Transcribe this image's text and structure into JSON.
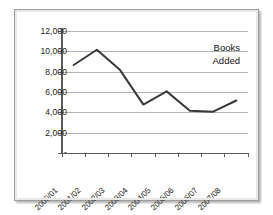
{
  "chart_data": {
    "type": "line",
    "title": "",
    "subtitle": "",
    "xlabel": "",
    "ylabel": "",
    "categories": [
      "2000/01",
      "2001/02",
      "2002/03",
      "2003/04",
      "2004/05",
      "2005/06",
      "2006/07",
      "2007/08"
    ],
    "series": [
      {
        "name": "Books Added",
        "values": [
          8700,
          10200,
          8200,
          4800,
          6100,
          4200,
          4100,
          5200
        ]
      }
    ],
    "ylim": [
      0,
      12000
    ],
    "ytick_values": [
      0,
      2000,
      4000,
      6000,
      8000,
      10000,
      12000
    ],
    "ytick_labels": [
      "-",
      "2,000",
      "4,000",
      "6,000",
      "8,000",
      "10,000",
      "12,000"
    ],
    "grid": true,
    "grid_axis": "y",
    "legend": "none",
    "annotations": [
      {
        "name": "series-label",
        "lines": [
          "Books",
          "Added"
        ],
        "position": "top-right-inside-plot"
      }
    ],
    "colors": {
      "line": "#3a3a3a",
      "grid": "#b4b4b4",
      "axis": "#5a5a5a",
      "text": "#1a1a1a",
      "plot_background": "#ffffff",
      "frame_border": "#9d9d9d"
    },
    "line_width": 2,
    "markers": false
  }
}
